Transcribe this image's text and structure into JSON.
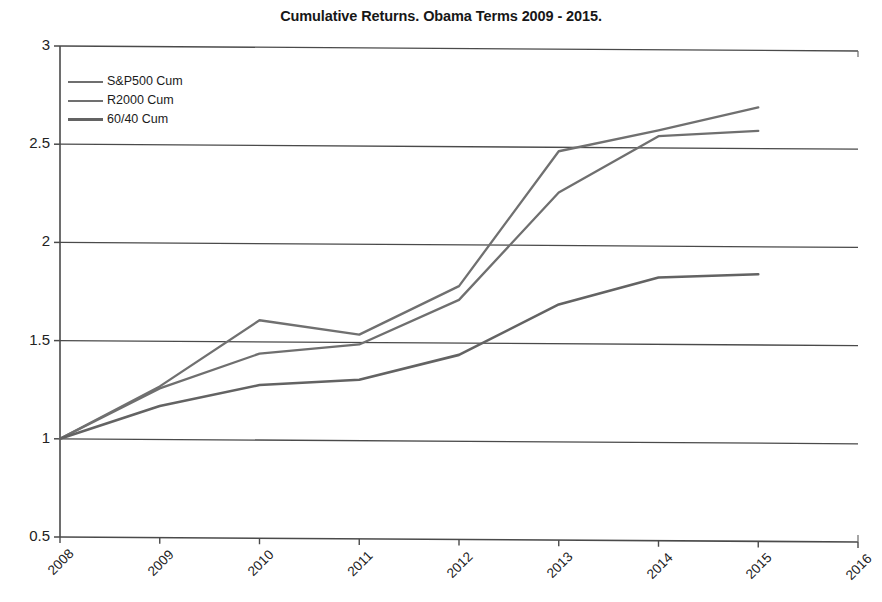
{
  "chart_data": {
    "type": "line",
    "title": "Cumulative Returns. Obama Terms 2009 - 2015.",
    "xlabel": "",
    "ylabel": "",
    "x": [
      2008,
      2009,
      2010,
      2011,
      2012,
      2013,
      2014,
      2015
    ],
    "xlim": [
      2008,
      2016
    ],
    "ylim": [
      0.5,
      3
    ],
    "yticks": [
      "0.5",
      "1",
      "1.5",
      "2",
      "2.5",
      "3"
    ],
    "ytick_values": [
      0.5,
      1,
      1.5,
      2,
      2.5,
      3
    ],
    "xticks": [
      "2008",
      "2009",
      "2010",
      "2011",
      "2012",
      "2013",
      "2014",
      "2015",
      "2016"
    ],
    "grid": "horizontal",
    "legend_position": "top-left-inside",
    "series": [
      {
        "name": "S&P500 Cum",
        "color": "#6f6f6f",
        "values": [
          1.0,
          1.26,
          1.44,
          1.49,
          1.72,
          2.27,
          2.56,
          2.59
        ]
      },
      {
        "name": "R2000 Cum",
        "color": "#707070",
        "values": [
          1.0,
          1.27,
          1.61,
          1.54,
          1.79,
          2.48,
          2.59,
          2.71
        ]
      },
      {
        "name": "60/40 Cum",
        "color": "#636363",
        "values": [
          1.0,
          1.17,
          1.28,
          1.31,
          1.44,
          1.7,
          1.84,
          1.86
        ]
      }
    ]
  },
  "legend": {
    "items": [
      {
        "label": "S&P500 Cum"
      },
      {
        "label": "R2000 Cum"
      },
      {
        "label": "60/40 Cum"
      }
    ]
  }
}
